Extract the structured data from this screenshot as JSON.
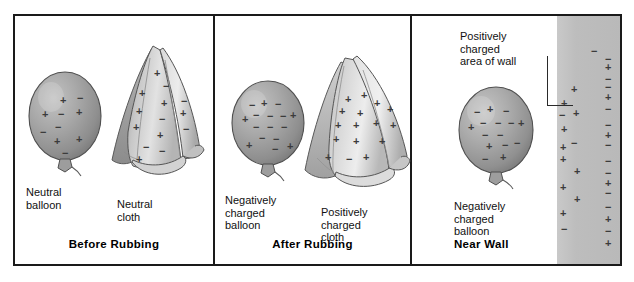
{
  "figure": {
    "width": 634,
    "height": 282,
    "background": "#ffffff",
    "border_color": "#1a1a1a"
  },
  "panels": [
    {
      "id": "before-rubbing",
      "caption": "Before Rubbing",
      "objects": [
        {
          "name": "neutral-balloon",
          "label": "Neutral\nballoon",
          "charges": [
            "+",
            "−",
            "+",
            "−",
            "+",
            "−",
            "−",
            "+",
            "+",
            "−"
          ]
        },
        {
          "name": "neutral-cloth",
          "label": "Neutral\ncloth",
          "charges": [
            "+",
            "−",
            "+",
            "+",
            "−",
            "+",
            "+",
            "−",
            "+",
            "−",
            "+",
            "−",
            "−",
            "+"
          ]
        }
      ]
    },
    {
      "id": "after-rubbing",
      "caption": "After Rubbing",
      "objects": [
        {
          "name": "negatively-charged-balloon",
          "label": "Negatively\ncharged\nballoon",
          "charges": [
            "−",
            "+",
            "−",
            "−",
            "+",
            "−",
            "−",
            "+",
            "−",
            "−",
            "−",
            "−",
            "+",
            "−",
            "−",
            "+"
          ]
        },
        {
          "name": "positively-charged-cloth",
          "label": "Positively\ncharged\ncloth",
          "charges": [
            "+",
            "+",
            "+",
            "+",
            "+",
            "+",
            "+",
            "+",
            "+",
            "+",
            "+",
            "+",
            "+",
            "−",
            "+",
            "+"
          ]
        }
      ]
    },
    {
      "id": "near-wall",
      "caption": "Near Wall",
      "objects": [
        {
          "name": "negatively-charged-balloon",
          "label": "Negatively\ncharged\nballoon",
          "charges": [
            "−",
            "+",
            "−",
            "−",
            "+",
            "−",
            "−",
            "+",
            "−",
            "−",
            "+",
            "−",
            "−",
            "−",
            "+"
          ]
        },
        {
          "name": "wall",
          "label": "Positively\ncharged\narea of wall",
          "charges_near_column": [
            "+",
            "+",
            "−",
            "+",
            "+",
            "−",
            "+",
            "+",
            "+",
            "+",
            "+",
            "+",
            "−"
          ],
          "charges_far_column": [
            "−",
            "−",
            "+",
            "−",
            "−",
            "+",
            "−",
            "−",
            "+",
            "−",
            "−",
            "−",
            "+",
            "−",
            "−",
            "+",
            "−",
            "+"
          ]
        }
      ]
    }
  ],
  "colors": {
    "wall_gray": "#bdbdbd",
    "balloon_gray": "#9a9a9a",
    "cloth_gray": "#cfcfcf",
    "charge_ink": "#3b3b3b",
    "text_ink": "#111111"
  }
}
